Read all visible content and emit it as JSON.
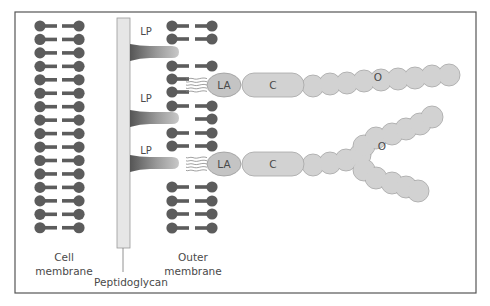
{
  "figure": {
    "frame": {
      "x": 15,
      "y": 12,
      "width": 461,
      "height": 281,
      "stroke": "#555555"
    },
    "colors": {
      "lipid": "#5c5c5c",
      "wall_fill": "#e6e6e6",
      "wall_stroke": "#9a9a9a",
      "lps_fill": "#d2d2d2",
      "lps_stroke": "#a6a6a6",
      "lp_dark": "#555555",
      "lp_light": "#b8b8b8",
      "text": "#4a4a4a"
    },
    "labels": {
      "cell_membrane_line1": "Cell",
      "cell_membrane_line2": "membrane",
      "outer_membrane_line1": "Outer",
      "outer_membrane_line2": "membrane",
      "peptidoglycan": "Peptidoglycan",
      "lipoprotein": "LP",
      "lipid_a": "LA",
      "core": "C",
      "o_antigen": "O"
    },
    "cell_membrane": {
      "left_head_x": 40,
      "right_head_x": 79,
      "row_start_y": 26,
      "row_step": 13.45,
      "row_count": 16
    },
    "peptidoglycan": {
      "x": 117,
      "y": 18,
      "width": 13,
      "height": 230,
      "label_line_x": 123,
      "label_line_to_y": 272
    },
    "outer_membrane": {
      "left_head_x": 172,
      "right_head_x": 212,
      "rows": [
        {
          "y": 26,
          "left": true,
          "right": true
        },
        {
          "y": 39,
          "left": true,
          "right": true
        },
        {
          "y": 66,
          "left": true,
          "right": true
        },
        {
          "y": 79,
          "left": true,
          "right": false
        },
        {
          "y": 92,
          "left": true,
          "right": false
        },
        {
          "y": 106,
          "left": true,
          "right": true
        },
        {
          "y": 119,
          "left": false,
          "right": true
        },
        {
          "y": 133,
          "left": true,
          "right": true
        },
        {
          "y": 146,
          "left": true,
          "right": true
        },
        {
          "y": 187,
          "left": true,
          "right": true
        },
        {
          "y": 201,
          "left": true,
          "right": true
        },
        {
          "y": 214,
          "left": true,
          "right": true
        },
        {
          "y": 228,
          "left": true,
          "right": true
        }
      ]
    },
    "lipoproteins": [
      {
        "y": 52,
        "label_y": 35
      },
      {
        "y": 118,
        "label_y": 102
      },
      {
        "y": 163,
        "label_y": 154
      }
    ],
    "lps": [
      {
        "y": 85,
        "o_chain": [
          [
            313,
            86
          ],
          [
            330,
            84
          ],
          [
            347,
            83
          ],
          [
            364,
            81
          ],
          [
            381,
            80
          ],
          [
            398,
            79
          ],
          [
            415,
            78
          ],
          [
            432,
            76
          ],
          [
            449,
            75
          ]
        ],
        "o_label": [
          378,
          81
        ]
      },
      {
        "y": 164,
        "o_chain": [
          [
            313,
            165
          ],
          [
            330,
            163
          ],
          [
            346,
            160
          ],
          [
            360,
            155
          ],
          [
            364,
            146
          ],
          [
            376,
            138
          ],
          [
            392,
            134
          ],
          [
            406,
            129
          ],
          [
            420,
            124
          ],
          [
            432,
            117
          ],
          [
            364,
            170
          ],
          [
            376,
            178
          ],
          [
            392,
            183
          ],
          [
            406,
            187
          ],
          [
            418,
            191
          ]
        ],
        "o_label": [
          382,
          150
        ]
      }
    ]
  }
}
